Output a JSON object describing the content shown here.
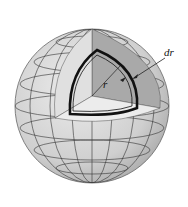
{
  "diagram": {
    "type": "sphere-cutaway",
    "labels": {
      "thickness": "dr",
      "radius": "r"
    },
    "colors": {
      "sphere_surface": "#d6d6d6",
      "cut_face_dark": "#a9a9a9",
      "cut_face_light": "#e2e2e2",
      "grid_lines": "#333333",
      "shell_outline": "#111111"
    }
  }
}
